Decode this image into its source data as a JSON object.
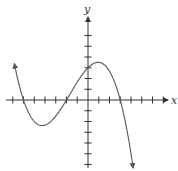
{
  "chart_data": {
    "type": "line",
    "title": "",
    "xlabel": "x",
    "ylabel": "y",
    "grid": false,
    "legend": null,
    "x_ticks": [
      -7,
      -6,
      -5,
      -4,
      -3,
      -2,
      -1,
      1,
      2,
      3,
      4,
      5,
      6,
      7
    ],
    "y_ticks": [
      -7,
      -6,
      -5,
      -4,
      -3,
      -2,
      -1,
      1,
      2,
      3,
      4,
      5,
      6
    ],
    "tick_labels_shown": false,
    "xlim": [
      -8,
      8
    ],
    "ylim": [
      -7.5,
      8
    ],
    "series": [
      {
        "name": "cubic curve",
        "description": "Cubic polynomial with positive leading behaviour on left going up, arrow ends on both sides",
        "roots": [
          -6,
          -2,
          3
        ],
        "y_intercept": 3,
        "local_max": {
          "x": 0.8,
          "y": 3.4
        },
        "local_min": {
          "x": -4.1,
          "y": -1.6
        },
        "points": [
          {
            "x": -6.8,
            "y": 6.0
          },
          {
            "x": -6,
            "y": 0
          },
          {
            "x": -5,
            "y": -1.3
          },
          {
            "x": -4,
            "y": -1.6
          },
          {
            "x": -3,
            "y": -1.1
          },
          {
            "x": -2,
            "y": 0
          },
          {
            "x": -1,
            "y": 1.6
          },
          {
            "x": 0,
            "y": 3.0
          },
          {
            "x": 1,
            "y": 3.4
          },
          {
            "x": 2,
            "y": 2.4
          },
          {
            "x": 3,
            "y": 0
          },
          {
            "x": 4,
            "y": -3.5
          }
        ],
        "end_arrows": true
      }
    ]
  },
  "axes": {
    "x_label": "x",
    "y_label": "y"
  },
  "colors": {
    "axis": "#333333",
    "curve": "#555555"
  }
}
